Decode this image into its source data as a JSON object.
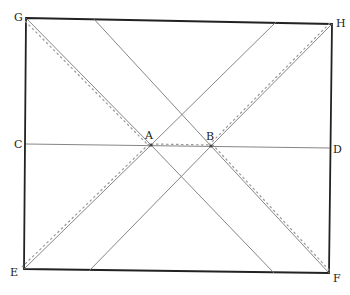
{
  "diagram": {
    "type": "geometric-construction",
    "points": {
      "G": {
        "label": "G",
        "x": 26,
        "y": 18
      },
      "H": {
        "label": "H",
        "x": 332,
        "y": 24
      },
      "E": {
        "label": "E",
        "x": 24,
        "y": 269
      },
      "F": {
        "label": "F",
        "x": 329,
        "y": 273
      },
      "C": {
        "label": "C",
        "x": 26,
        "y": 144
      },
      "D": {
        "label": "D",
        "x": 330,
        "y": 148
      },
      "A": {
        "label": "A",
        "x": 151,
        "y": 145
      },
      "B": {
        "label": "B",
        "x": 211,
        "y": 146
      }
    },
    "auxiliary_points": {
      "top_left_cross": {
        "x": 93,
        "y": 18
      },
      "top_right_cross": {
        "x": 276,
        "y": 22
      },
      "bottom_left_cross": {
        "x": 89,
        "y": 271
      },
      "bottom_right_cross": {
        "x": 274,
        "y": 273
      },
      "upper_intersection": {
        "x": 182,
        "y": 116
      },
      "lower_intersection": {
        "x": 182,
        "y": 177
      }
    },
    "segments": [
      {
        "name": "frame-GHFE",
        "style": "thick",
        "from": "G",
        "via": [
          "H",
          "F",
          "E"
        ],
        "closed": true
      },
      {
        "name": "line-CD",
        "style": "thin",
        "from": "C",
        "to": "D"
      },
      {
        "name": "line-GA",
        "style": "dashed-overlay",
        "from": "G",
        "to": "A"
      },
      {
        "name": "line-A-bottom",
        "style": "thin",
        "from": "A",
        "to": "bottom_right_cross"
      },
      {
        "name": "line-top-B",
        "style": "thin",
        "from": "top_left_cross",
        "to": "B"
      },
      {
        "name": "line-BF",
        "style": "dashed-overlay",
        "from": "B",
        "to": "F"
      },
      {
        "name": "line-HB",
        "style": "dashed-overlay",
        "from": "H",
        "to": "B"
      },
      {
        "name": "line-B-bottom",
        "style": "thin",
        "from": "B",
        "to": "bottom_left_cross"
      },
      {
        "name": "line-top-A",
        "style": "thin",
        "from": "top_right_cross",
        "to": "A"
      },
      {
        "name": "line-AE",
        "style": "dashed-overlay",
        "from": "A",
        "to": "E"
      },
      {
        "name": "line-AB",
        "style": "dashed-overlay",
        "from": "A",
        "to": "B"
      }
    ],
    "labels": {
      "G": "G",
      "H": "H",
      "E": "E",
      "F": "F",
      "C": "C",
      "D": "D",
      "A": "A",
      "B": "B"
    },
    "colors": {
      "frame": "#222222",
      "line": "#777777",
      "dash": "#999999",
      "background": "#ffffff"
    }
  }
}
